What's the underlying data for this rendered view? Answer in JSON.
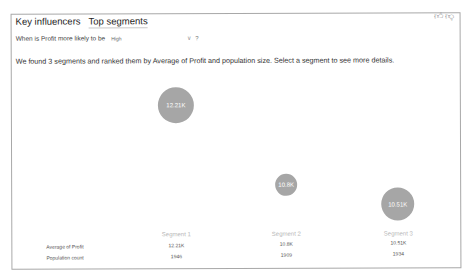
{
  "tabs": [
    {
      "label": "Key influencers",
      "active": false
    },
    {
      "label": "Top segments",
      "active": true
    }
  ],
  "question": {
    "prefix": "When is Profit more likely to be",
    "dropdown_value": "High",
    "help": "?"
  },
  "summary": "We found 3 segments and ranked them by Average of Profit and population size. Select a segment to see more details.",
  "icons": {
    "thumbs_up": "thumbs-up-icon",
    "thumbs_down": "thumbs-down-icon"
  },
  "segments": [
    {
      "name": "Segment 1",
      "avg_profit": "12.21K",
      "population": "1946",
      "bubble_label": "12.21K"
    },
    {
      "name": "Segment 2",
      "avg_profit": "10.8K",
      "population": "1909",
      "bubble_label": "10.8K"
    },
    {
      "name": "Segment 3",
      "avg_profit": "10.51K",
      "population": "1934",
      "bubble_label": "10.51K"
    }
  ],
  "row_labels": {
    "avg_profit": "Average of Profit",
    "population": "Population count"
  },
  "colors": {
    "bubble": "#a6a6a6",
    "segment_label": "#b8b8b8"
  }
}
